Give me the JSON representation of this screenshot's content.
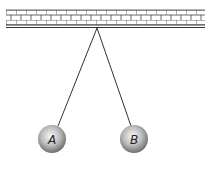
{
  "diagram": {
    "type": "pendulum-pair",
    "ceiling": {
      "pattern": "brick-wall"
    },
    "pivot": {
      "x": 97,
      "y": 28
    },
    "balls": [
      {
        "label": "A",
        "cx": 52,
        "cy": 139,
        "r": 14
      },
      {
        "label": "B",
        "cx": 134,
        "cy": 139,
        "r": 14
      }
    ],
    "colors": {
      "line": "#333333",
      "ball_light": "#f4f4f4",
      "ball_dark": "#7a7a7a"
    }
  }
}
